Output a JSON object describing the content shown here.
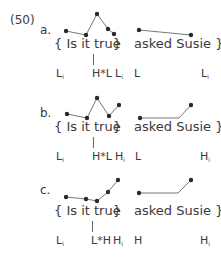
{
  "example_number": "(50)",
  "panels": [
    {
      "letter": "a.",
      "phrase1": "{ Is it true",
      "brace1": "}",
      "phrase2": "asked Susie }",
      "tones": [
        {
          "base": "L",
          "sub": "i"
        },
        {
          "base": "H*L",
          "sub": ""
        },
        {
          "base": "L",
          "sub": "i"
        },
        {
          "base": "L",
          "sub": ""
        },
        {
          "base": "L",
          "sub": "i"
        }
      ],
      "contour1": [
        [
          66,
          31
        ],
        [
          86,
          35
        ],
        [
          97,
          14
        ],
        [
          108,
          29
        ],
        [
          114,
          34
        ]
      ],
      "contour2": [
        [
          139,
          30
        ],
        [
          191,
          35
        ]
      ],
      "contour2_knee": null
    },
    {
      "letter": "b.",
      "phrase1": "{ Is it true",
      "brace1": "}",
      "phrase2": "asked Susie }",
      "tones": [
        {
          "base": "L",
          "sub": "i"
        },
        {
          "base": "H*L",
          "sub": ""
        },
        {
          "base": "H",
          "sub": "i"
        },
        {
          "base": "L",
          "sub": ""
        },
        {
          "base": "H",
          "sub": "i"
        }
      ],
      "contour1": [
        [
          67,
          114
        ],
        [
          87,
          118
        ],
        [
          97,
          98
        ],
        [
          109,
          116
        ],
        [
          119,
          105
        ]
      ],
      "contour2": [
        [
          140,
          118
        ],
        [
          191,
          105
        ]
      ],
      "contour2_knee": [
        179,
        118
      ]
    },
    {
      "letter": "c.",
      "phrase1": "{ Is it true",
      "brace1": "}",
      "phrase2": "asked Susie }",
      "tones": [
        {
          "base": "L",
          "sub": "i"
        },
        {
          "base": "L*H",
          "sub": ""
        },
        {
          "base": "H",
          "sub": "i"
        },
        {
          "base": "H",
          "sub": ""
        },
        {
          "base": "H",
          "sub": "i"
        }
      ],
      "contour1": [
        [
          66,
          197
        ],
        [
          86,
          199
        ],
        [
          97,
          201
        ],
        [
          108,
          192
        ],
        [
          118,
          180
        ]
      ],
      "contour2": [
        [
          139,
          193
        ],
        [
          191,
          180
        ]
      ],
      "contour2_knee": [
        178,
        193
      ]
    }
  ],
  "colors": {
    "dot": "#2a2a2a",
    "line": "#777777",
    "text": "#3a3a3a"
  }
}
